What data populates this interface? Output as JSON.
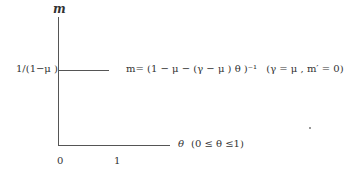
{
  "diagram": {
    "y_axis_label": "m",
    "x_axis_label": "θ",
    "x_axis_range_note": "(0 ≤ θ ≤1)",
    "y_level_label": "1/(1−μ )",
    "equation": "m= (1 − μ  − (γ − μ ) θ )⁻¹",
    "condition": "(γ = μ , m′ = 0)",
    "x_ticks": [
      "0",
      "1"
    ],
    "colors": {
      "axis": "#555555",
      "text": "#333333",
      "background": "#ffffff"
    }
  }
}
